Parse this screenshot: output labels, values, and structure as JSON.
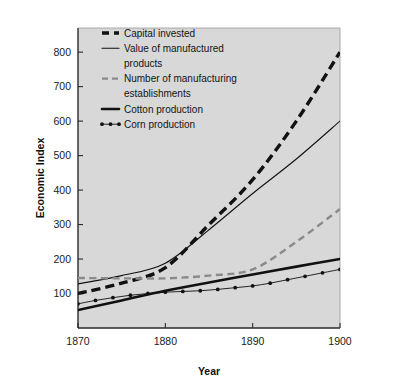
{
  "chart_data": {
    "type": "line",
    "title": "",
    "subtitle": "",
    "xlabel": "Year",
    "ylabel": "Economic Index",
    "xlim": [
      1870,
      1900
    ],
    "ylim": [
      0,
      870
    ],
    "xticks": [
      1870,
      1880,
      1890,
      1900
    ],
    "xticklabels": [
      "1870",
      "1880",
      "1890",
      "1900"
    ],
    "yticks": [
      100,
      200,
      300,
      400,
      500,
      600,
      700,
      800
    ],
    "yticklabels": [
      "100",
      "200",
      "300",
      "400",
      "500",
      "600",
      "700",
      "800"
    ],
    "grid": false,
    "legend_position": "upper left",
    "plot_background": "#d8d8d8",
    "series": [
      {
        "name": "Capital invested",
        "style": "thick-dashed",
        "color": "#111111",
        "x": [
          1870,
          1875,
          1880,
          1885,
          1890,
          1895,
          1900
        ],
        "values": [
          100,
          130,
          175,
          300,
          430,
          600,
          800
        ]
      },
      {
        "name": "Value of manufactured products",
        "style": "thin-solid",
        "color": "#111111",
        "x": [
          1870,
          1875,
          1880,
          1885,
          1890,
          1895,
          1900
        ],
        "values": [
          128,
          152,
          188,
          285,
          390,
          490,
          600
        ]
      },
      {
        "name": "Number of manufacturing establishments",
        "style": "gray-dashed",
        "color": "#8a8a8a",
        "x": [
          1870,
          1875,
          1880,
          1885,
          1890,
          1895,
          1900
        ],
        "values": [
          145,
          144,
          144,
          152,
          170,
          250,
          345
        ]
      },
      {
        "name": "Cotton production",
        "style": "thick-solid",
        "color": "#111111",
        "x": [
          1870,
          1875,
          1880,
          1885,
          1890,
          1895,
          1900
        ],
        "values": [
          52,
          80,
          108,
          132,
          155,
          178,
          200
        ]
      },
      {
        "name": "Corn production",
        "style": "dotted-marker",
        "color": "#111111",
        "x": [
          1870,
          1872,
          1874,
          1876,
          1878,
          1880,
          1882,
          1884,
          1886,
          1888,
          1890,
          1892,
          1894,
          1896,
          1898,
          1900
        ],
        "values": [
          70,
          80,
          88,
          95,
          100,
          104,
          106,
          108,
          112,
          117,
          122,
          130,
          140,
          150,
          160,
          170
        ]
      }
    ]
  },
  "legend": {
    "entries": [
      {
        "label": "Capital invested"
      },
      {
        "label": "Value of manufactured"
      },
      {
        "label": "products"
      },
      {
        "label": "Number of manufacturing"
      },
      {
        "label": "establishments"
      },
      {
        "label": "Cotton production"
      },
      {
        "label": "Corn production"
      }
    ]
  }
}
